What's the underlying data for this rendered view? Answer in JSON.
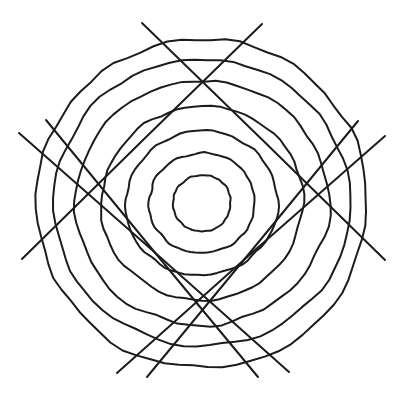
{
  "document": {
    "title": "Concentric Circles with Crossing Chords",
    "background_color": "#ffffff",
    "stroke_color": "#1c1c1c",
    "width": 404,
    "height": 396
  },
  "figure": {
    "name": "concentric-circle-chord-figure",
    "style": "hand-drawn line art",
    "center": {
      "x": 202,
      "y": 203
    },
    "ring_count": 6,
    "chord_count": 6,
    "rings": [
      {
        "label": "ring-1-innermost",
        "rx": 29,
        "ry": 28,
        "rotation": -6,
        "stroke_width": 2.0,
        "wobble": 1.2
      },
      {
        "label": "ring-2",
        "rx": 53,
        "ry": 50,
        "rotation": -8,
        "stroke_width": 2.0,
        "wobble": 1.8
      },
      {
        "label": "ring-3",
        "rx": 76,
        "ry": 72,
        "rotation": -7,
        "stroke_width": 2.0,
        "wobble": 2.2
      },
      {
        "label": "ring-4",
        "rx": 101,
        "ry": 97,
        "rotation": -5,
        "stroke_width": 2.0,
        "wobble": 2.6
      },
      {
        "label": "ring-5",
        "rx": 127,
        "ry": 122,
        "rotation": -4,
        "stroke_width": 2.0,
        "wobble": 3.0
      },
      {
        "label": "ring-6",
        "rx": 148,
        "ry": 143,
        "rotation": -3,
        "stroke_width": 2.0,
        "wobble": 3.2
      },
      {
        "label": "ring-7-outermost",
        "rx": 166,
        "ry": 164,
        "rotation": -2,
        "stroke_width": 2.0,
        "wobble": 3.4
      }
    ],
    "chords": [
      {
        "label": "chord-1",
        "x1": 142,
        "y1": 23,
        "x2": 385,
        "y2": 260,
        "stroke_width": 2.0
      },
      {
        "label": "chord-2",
        "x1": 262,
        "y1": 24,
        "x2": 22,
        "y2": 259,
        "stroke_width": 2.0
      },
      {
        "label": "chord-3",
        "x1": 19,
        "y1": 133,
        "x2": 289,
        "y2": 372,
        "stroke_width": 2.0
      },
      {
        "label": "chord-4",
        "x1": 385,
        "y1": 136,
        "x2": 117,
        "y2": 373,
        "stroke_width": 2.0
      },
      {
        "label": "chord-5",
        "x1": 46,
        "y1": 120,
        "x2": 258,
        "y2": 377,
        "stroke_width": 2.0
      },
      {
        "label": "chord-6",
        "x1": 358,
        "y1": 121,
        "x2": 147,
        "y2": 377,
        "stroke_width": 2.0
      }
    ]
  },
  "chart_data": {
    "type": "diagram",
    "elements": {
      "concentric_circles": 7,
      "straight_lines": 6,
      "innermost_radius_px": 28,
      "outermost_radius_px": 165,
      "line_color": "#1c1c1c",
      "fill_color": "none",
      "background_color": "#ffffff"
    },
    "xlabel": "",
    "ylabel": "",
    "grid": false,
    "legend": "none"
  }
}
